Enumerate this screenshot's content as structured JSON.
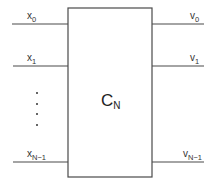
{
  "diagram": {
    "block": {
      "label": "C",
      "subscript": "N"
    },
    "inputs": [
      {
        "base": "x",
        "subscript": "0"
      },
      {
        "base": "x",
        "subscript": "1"
      },
      {
        "base": "x",
        "subscript": "N−1"
      }
    ],
    "outputs": [
      {
        "base": "v",
        "subscript": "0"
      },
      {
        "base": "v",
        "subscript": "1"
      },
      {
        "base": "v",
        "subscript": "N−1"
      }
    ],
    "ellipsis": "vertical dots (4) between x1 and xN-1",
    "colors": {
      "stroke": "#4a4a4a",
      "text": "#333333",
      "background": "#ffffff"
    }
  }
}
